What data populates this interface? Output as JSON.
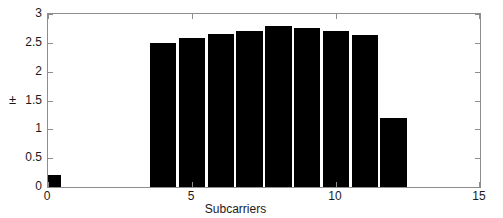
{
  "chart_data": {
    "type": "bar",
    "title": "",
    "subtitle": "",
    "xlabel": "Subcarriers",
    "ylabel": "±",
    "x": [
      0,
      4,
      5,
      6,
      7,
      8,
      9,
      10,
      11,
      12
    ],
    "values": [
      0.2,
      2.5,
      2.58,
      2.65,
      2.71,
      2.8,
      2.76,
      2.7,
      2.64,
      1.2
    ],
    "bar_width": 0.92,
    "xlim": [
      0,
      15
    ],
    "ylim": [
      0,
      3
    ],
    "xticks": [
      0,
      5,
      10,
      15
    ],
    "xticklabels": [
      "0",
      "5",
      "10",
      "15"
    ],
    "yticks": [
      0,
      0.5,
      1,
      1.5,
      2,
      2.5,
      3
    ],
    "yticklabels": [
      "0",
      "0.5",
      "1",
      "1.5",
      "2",
      "2.5",
      "3"
    ],
    "grid": false,
    "legend": null,
    "bar_color": "#000000",
    "axis_color": "#8d8d8d",
    "background": "#ffffff",
    "annotations": []
  }
}
